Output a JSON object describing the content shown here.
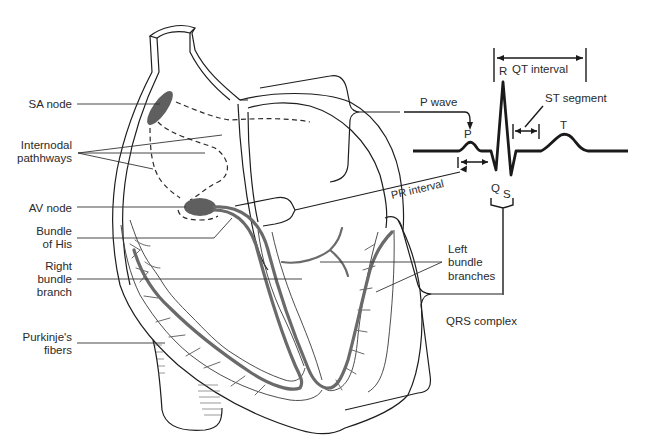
{
  "colors": {
    "outline": "#1e1e1e",
    "node_fill": "#5f5f5f",
    "conduction_path": "#6a6a6a",
    "background": "#ffffff"
  },
  "left_labels": {
    "sa_node": "SA node",
    "internodal_1": "Internodal",
    "internodal_2": "pathhways",
    "av_node": "AV node",
    "bundle_his_1": "Bundle",
    "bundle_his_2": "of His",
    "right_bundle_1": "Right",
    "right_bundle_2": "bundle",
    "right_bundle_3": "branch",
    "purkinje_1": "Purkinje's",
    "purkinje_2": "fibers"
  },
  "right_labels": {
    "left_bundle_1": "Left",
    "left_bundle_2": "bundle",
    "left_bundle_3": "branches",
    "qrs_complex": "QRS complex",
    "p_wave": "P wave",
    "pr_interval": "PR interval"
  },
  "ecg": {
    "p": "P",
    "q": "Q",
    "r": "R",
    "s": "S",
    "t": "T",
    "qt_interval": "QT interval",
    "st_segment": "ST segment"
  }
}
